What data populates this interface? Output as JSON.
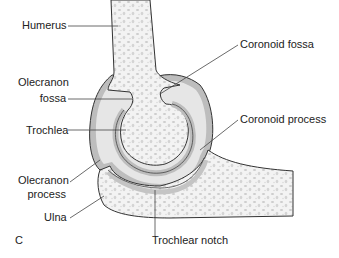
{
  "figure": {
    "panel_letter": "C",
    "colors": {
      "bone_fill": "#f1f1f1",
      "bone_pore": "#cfcfcf",
      "outline": "#333333",
      "cartilage_outer": "#bdbdbd",
      "cartilage_inner": "#e2e2e2",
      "leader_line": "#444444",
      "text": "#222222"
    }
  },
  "labels": {
    "humerus": "Humerus",
    "olecranon_fossa_1": "Olecranon",
    "olecranon_fossa_2": "fossa",
    "trochlea": "Trochlea",
    "olecranon_process_1": "Olecranon",
    "olecranon_process_2": "process",
    "ulna": "Ulna",
    "coronoid_fossa": "Coronoid fossa",
    "coronoid_process": "Coronoid process",
    "trochlear_notch": "Trochlear notch"
  }
}
